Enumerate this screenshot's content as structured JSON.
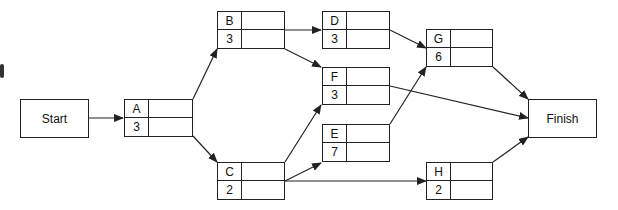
{
  "diagram": {
    "type": "activity-on-node network",
    "start": {
      "label": "Start"
    },
    "finish": {
      "label": "Finish"
    },
    "activities": [
      {
        "id": "A",
        "duration": "3"
      },
      {
        "id": "B",
        "duration": "3"
      },
      {
        "id": "C",
        "duration": "2"
      },
      {
        "id": "D",
        "duration": "3"
      },
      {
        "id": "E",
        "duration": "7"
      },
      {
        "id": "F",
        "duration": "3"
      },
      {
        "id": "G",
        "duration": "6"
      },
      {
        "id": "H",
        "duration": "2"
      }
    ],
    "edges": [
      [
        "Start",
        "A"
      ],
      [
        "A",
        "B"
      ],
      [
        "A",
        "C"
      ],
      [
        "B",
        "D"
      ],
      [
        "B",
        "F"
      ],
      [
        "C",
        "F"
      ],
      [
        "C",
        "E"
      ],
      [
        "C",
        "H"
      ],
      [
        "D",
        "G"
      ],
      [
        "E",
        "G"
      ],
      [
        "F",
        "Finish"
      ],
      [
        "G",
        "Finish"
      ],
      [
        "H",
        "Finish"
      ]
    ],
    "line_color": "#222222"
  }
}
